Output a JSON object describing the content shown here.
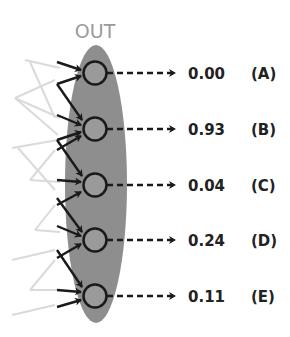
{
  "diagram": {
    "layer_title": "OUT",
    "colors": {
      "ellipse": "#8e8e8e",
      "node_fill": "#9a9a9a",
      "node_stroke": "#1a1a1a",
      "incoming_dark": "#1a1a1a",
      "incoming_faint": "#d8d8d8",
      "text": "#222222",
      "title": "#9a9a9a"
    },
    "outputs": [
      {
        "value": "0.00",
        "label": "(A)"
      },
      {
        "value": "0.93",
        "label": "(B)"
      },
      {
        "value": "0.04",
        "label": "(C)"
      },
      {
        "value": "0.24",
        "label": "(D)"
      },
      {
        "value": "0.11",
        "label": "(E)"
      }
    ]
  }
}
